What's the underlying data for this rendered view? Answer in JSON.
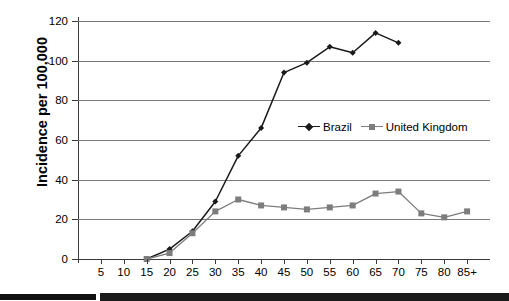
{
  "chart_data": {
    "type": "line",
    "title": "",
    "xlabel": "",
    "ylabel": "Incidence per 100,000",
    "categories": [
      "5",
      "10",
      "15",
      "20",
      "25",
      "30",
      "35",
      "40",
      "45",
      "50",
      "55",
      "60",
      "65",
      "70",
      "75",
      "80",
      "85+"
    ],
    "ylim": [
      0,
      120
    ],
    "yticks": [
      0,
      20,
      40,
      60,
      80,
      100,
      120
    ],
    "ytick_labels": [
      "0",
      "20",
      "40",
      "60",
      "80",
      "100",
      "120"
    ],
    "grid": true,
    "legend_position": "center-right",
    "series": [
      {
        "name": "Brazil",
        "color": "#1a1a1a",
        "marker": "diamond",
        "values": [
          null,
          null,
          0,
          5,
          14,
          29,
          52,
          66,
          94,
          99,
          107,
          104,
          114,
          109,
          null,
          null,
          null
        ]
      },
      {
        "name": "United Kingdom",
        "color": "#7d7d7d",
        "marker": "square",
        "values": [
          null,
          null,
          0,
          3,
          13,
          24,
          30,
          27,
          26,
          25,
          26,
          27,
          33,
          34,
          23,
          21,
          24
        ]
      }
    ]
  },
  "legend": {
    "items": [
      {
        "label": "Brazil",
        "color": "#1a1a1a",
        "marker": "diamond"
      },
      {
        "label": "United Kingdom",
        "color": "#7d7d7d",
        "marker": "square"
      }
    ]
  },
  "axis": {
    "y_title": "Incidence per 100,000"
  }
}
